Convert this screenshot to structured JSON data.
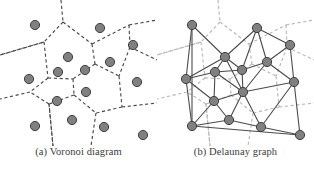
{
  "figure": {
    "background_color": "#ffffff"
  },
  "style": {
    "site_fill": "#808080",
    "site_stroke": "#3f3f3f",
    "site_radius": 4.6,
    "voronoi_edge_color": "#4a4a4a",
    "voronoi_edge_color_light": "#b9b9b9",
    "delaunay_edge_color": "#4a4a4a",
    "voronoi_dash": "3.2,2.6",
    "voronoi_stroke_width": 1.15,
    "delaunay_stroke_width": 1.1
  },
  "panels": [
    {
      "id": "voronoi",
      "caption": "(a) Voronoi diagram",
      "shows_voronoi_edges": true,
      "shows_delaunay_edges": false
    },
    {
      "id": "delaunay",
      "caption": "(b) Delaunay graph",
      "shows_voronoi_edges": true,
      "shows_delaunay_edges": true
    }
  ],
  "chart_data": {
    "type": "scatter",
    "xlabel": "",
    "ylabel": "",
    "xlim": [
      0,
      157
    ],
    "ylim": [
      0,
      146
    ],
    "grid": false,
    "legend": "none",
    "sites": [
      {
        "id": 0,
        "x": 35,
        "y": 25
      },
      {
        "id": 1,
        "x": 100,
        "y": 28
      },
      {
        "id": 2,
        "x": 133,
        "y": 45
      },
      {
        "id": 3,
        "x": 68,
        "y": 57
      },
      {
        "id": 4,
        "x": 110,
        "y": 62
      },
      {
        "id": 5,
        "x": 58,
        "y": 72
      },
      {
        "id": 6,
        "x": 85,
        "y": 70
      },
      {
        "id": 7,
        "x": 29,
        "y": 79
      },
      {
        "id": 8,
        "x": 137,
        "y": 82
      },
      {
        "id": 9,
        "x": 86,
        "y": 92
      },
      {
        "id": 10,
        "x": 57,
        "y": 101
      },
      {
        "id": 11,
        "x": 35,
        "y": 126
      },
      {
        "id": 12,
        "x": 72,
        "y": 120
      },
      {
        "id": 13,
        "x": 104,
        "y": 127
      },
      {
        "id": 14,
        "x": 143,
        "y": 135
      }
    ],
    "delaunay_edges": [
      [
        0,
        3
      ],
      [
        0,
        7
      ],
      [
        0,
        11
      ],
      [
        1,
        3
      ],
      [
        1,
        2
      ],
      [
        1,
        4
      ],
      [
        1,
        6
      ],
      [
        2,
        4
      ],
      [
        2,
        8
      ],
      [
        3,
        5
      ],
      [
        3,
        6
      ],
      [
        3,
        7
      ],
      [
        3,
        9
      ],
      [
        4,
        6
      ],
      [
        4,
        8
      ],
      [
        4,
        9
      ],
      [
        5,
        6
      ],
      [
        5,
        7
      ],
      [
        5,
        9
      ],
      [
        5,
        10
      ],
      [
        6,
        9
      ],
      [
        7,
        10
      ],
      [
        7,
        11
      ],
      [
        8,
        9
      ],
      [
        8,
        13
      ],
      [
        8,
        14
      ],
      [
        9,
        10
      ],
      [
        9,
        12
      ],
      [
        9,
        13
      ],
      [
        10,
        11
      ],
      [
        10,
        12
      ],
      [
        11,
        12
      ],
      [
        11,
        14
      ],
      [
        12,
        13
      ],
      [
        13,
        14
      ]
    ],
    "voronoi_edges": [
      [
        [
          61,
          0
        ],
        [
          63,
          22
        ]
      ],
      [
        [
          63,
          22
        ],
        [
          44,
          42
        ]
      ],
      [
        [
          63,
          22
        ],
        [
          92,
          44
        ]
      ],
      [
        [
          44,
          42
        ],
        [
          0,
          55
        ]
      ],
      [
        [
          44,
          42
        ],
        [
          48,
          78
        ]
      ],
      [
        [
          92,
          44
        ],
        [
          129,
          25
        ]
      ],
      [
        [
          92,
          44
        ],
        [
          95,
          64
        ]
      ],
      [
        [
          129,
          25
        ],
        [
          157,
          20
        ]
      ],
      [
        [
          129,
          25
        ],
        [
          130,
          47
        ]
      ],
      [
        [
          130,
          47
        ],
        [
          157,
          60
        ]
      ],
      [
        [
          130,
          47
        ],
        [
          119,
          76
        ]
      ],
      [
        [
          95,
          64
        ],
        [
          119,
          76
        ]
      ],
      [
        [
          95,
          64
        ],
        [
          73,
          79
        ]
      ],
      [
        [
          48,
          78
        ],
        [
          73,
          79
        ]
      ],
      [
        [
          48,
          78
        ],
        [
          30,
          92
        ]
      ],
      [
        [
          73,
          79
        ],
        [
          74,
          95
        ]
      ],
      [
        [
          119,
          76
        ],
        [
          122,
          107
        ]
      ],
      [
        [
          122,
          107
        ],
        [
          157,
          103
        ]
      ],
      [
        [
          122,
          107
        ],
        [
          96,
          113
        ]
      ],
      [
        [
          74,
          95
        ],
        [
          96,
          113
        ]
      ],
      [
        [
          74,
          95
        ],
        [
          49,
          104
        ]
      ],
      [
        [
          96,
          113
        ],
        [
          91,
          146
        ]
      ],
      [
        [
          49,
          104
        ],
        [
          30,
          92
        ]
      ],
      [
        [
          49,
          104
        ],
        [
          53,
          146
        ]
      ],
      [
        [
          30,
          92
        ],
        [
          0,
          99
        ]
      ],
      [
        [
          53,
          146
        ],
        [
          49,
          104
        ]
      ],
      [
        [
          0,
          55
        ],
        [
          44,
          42
        ]
      ]
    ]
  }
}
